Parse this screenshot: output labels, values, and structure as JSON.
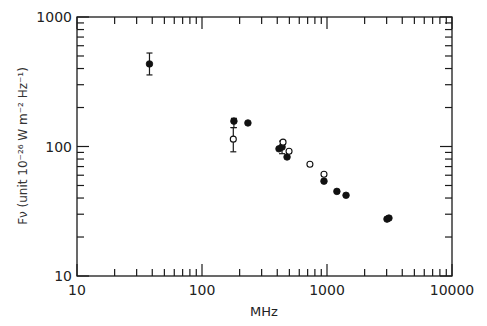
{
  "chart_data": {
    "type": "scatter",
    "title": "",
    "xlabel": "MHz",
    "ylabel": "Fν (unit 10⁻²⁶ W m⁻² Hz⁻¹)",
    "xscale": "log",
    "yscale": "log",
    "xlim": [
      10,
      10000
    ],
    "ylim": [
      10,
      1000
    ],
    "x_ticks": [
      "10",
      "100",
      "1000",
      "10000"
    ],
    "y_ticks": [
      "10",
      "100",
      "1000"
    ],
    "grid": false,
    "legend": null,
    "series": [
      {
        "name": "filled",
        "marker": "filled-circle",
        "points": [
          {
            "x": 38,
            "y": 434,
            "err_low": 357,
            "err_high": 527
          },
          {
            "x": 180,
            "y": 157,
            "err_low": 140,
            "err_high": 165
          },
          {
            "x": 233,
            "y": 152
          },
          {
            "x": 413,
            "y": 96
          },
          {
            "x": 437,
            "y": 99,
            "err_low": 88,
            "err_high": 110
          },
          {
            "x": 479,
            "y": 83
          },
          {
            "x": 946,
            "y": 54
          },
          {
            "x": 1200,
            "y": 45
          },
          {
            "x": 1420,
            "y": 42
          },
          {
            "x": 3020,
            "y": 27.5
          },
          {
            "x": 3130,
            "y": 28
          }
        ]
      },
      {
        "name": "open",
        "marker": "open-circle",
        "points": [
          {
            "x": 178,
            "y": 114,
            "err_low": 91,
            "err_high": 140
          },
          {
            "x": 445,
            "y": 108
          },
          {
            "x": 497,
            "y": 92
          },
          {
            "x": 730,
            "y": 73
          },
          {
            "x": 946,
            "y": 61
          }
        ]
      }
    ]
  }
}
